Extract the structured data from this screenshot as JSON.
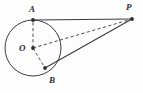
{
  "figure": {
    "background_color": "#fdfdfd",
    "stroke_color": "#3a3a42",
    "label_color": "#2f2f38",
    "width": 143,
    "height": 93
  },
  "labels": {
    "A": "A",
    "O": "O",
    "B": "B",
    "P": "P"
  },
  "points": {
    "A": {
      "name": "A",
      "x": 33,
      "y": 20,
      "role": "tangent-point",
      "marker": "filled-dot"
    },
    "O": {
      "name": "O",
      "x": 33,
      "y": 48,
      "role": "circle-center",
      "marker": "filled-dot"
    },
    "B": {
      "name": "B",
      "x": 45,
      "y": 68,
      "role": "tangent-point",
      "marker": "filled-dot"
    },
    "P": {
      "name": "P",
      "x": 132,
      "y": 19,
      "role": "external-point",
      "marker": "filled-dot"
    }
  },
  "circle": {
    "center_x": 33,
    "center_y": 48,
    "radius": 28,
    "style": "solid",
    "stroke_width": 1
  },
  "segments": [
    {
      "name": "AP",
      "from": "A",
      "to": "P",
      "style": "solid",
      "x1": 33,
      "y1": 20,
      "x2": 132,
      "y2": 19
    },
    {
      "name": "BP",
      "from": "B",
      "to": "P",
      "style": "solid",
      "x1": 45,
      "y1": 68,
      "x2": 132,
      "y2": 19
    },
    {
      "name": "OA",
      "from": "O",
      "to": "A",
      "style": "dashed",
      "x1": 33,
      "y1": 48,
      "x2": 33,
      "y2": 20
    },
    {
      "name": "OB",
      "from": "O",
      "to": "B",
      "style": "dashed",
      "x1": 33,
      "y1": 48,
      "x2": 45,
      "y2": 68
    },
    {
      "name": "OP",
      "from": "O",
      "to": "P",
      "style": "dashed",
      "x1": 33,
      "y1": 48,
      "x2": 132,
      "y2": 19
    }
  ]
}
